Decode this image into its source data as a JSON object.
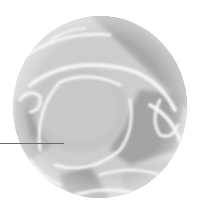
{
  "figure": {
    "kind": "magnified-circular-inset",
    "disc": {
      "cx": 100,
      "cy": 107,
      "rx": 87,
      "ry": 91,
      "base_color": "#c9c9c9",
      "light_color": "#efefef",
      "mid_color": "#bdbdbd",
      "dark_color": "#9a9a9a"
    },
    "leader_line": {
      "x1": 0,
      "y1": 143.5,
      "x2": 64,
      "y2": 143.5,
      "color": "#6a6a6a"
    }
  }
}
